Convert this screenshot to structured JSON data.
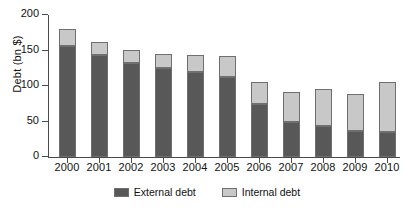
{
  "chart_data": {
    "type": "bar",
    "stacked": true,
    "title": "",
    "xlabel": "",
    "ylabel": "Debt (bn $)",
    "ylim": [
      0,
      200
    ],
    "yticks": [
      0,
      50,
      100,
      150,
      200
    ],
    "grid": false,
    "legend_position": "bottom",
    "categories": [
      "2000",
      "2001",
      "2002",
      "2003",
      "2004",
      "2005",
      "2006",
      "2007",
      "2008",
      "2009",
      "2010"
    ],
    "series": [
      {
        "name": "External debt",
        "color": "#585858",
        "values": [
          157,
          143,
          132,
          125,
          120,
          112,
          74,
          50,
          43,
          37,
          35
        ]
      },
      {
        "name": "Internal debt",
        "color": "#c8c8c8",
        "values": [
          24,
          19,
          19,
          20,
          23,
          30,
          32,
          41,
          53,
          52,
          70
        ]
      }
    ],
    "totals": [
      181,
      162,
      151,
      145,
      143,
      142,
      106,
      91,
      96,
      89,
      105
    ]
  },
  "axis": {
    "y_tick_labels": [
      "0",
      "50",
      "100",
      "150",
      "200"
    ],
    "y_axis_title": "Debt (bn $)"
  },
  "legend": {
    "entries": [
      {
        "label": "External debt"
      },
      {
        "label": "Internal debt"
      }
    ]
  },
  "colors": {
    "external": "#585858",
    "internal": "#c8c8c8",
    "axis": "#4a4a4a",
    "bar_outline": "#6f6f6f",
    "background": "#ffffff"
  }
}
